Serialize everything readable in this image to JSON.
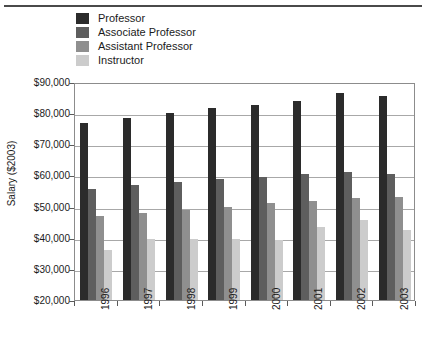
{
  "chart_data": {
    "type": "bar",
    "title": "",
    "xlabel": "",
    "ylabel": "Salary ($2003)",
    "categories": [
      "1996",
      "1997",
      "1998",
      "1999",
      "2000",
      "2001",
      "2002",
      "2003"
    ],
    "ylim": [
      20000,
      90000
    ],
    "ytick_values": [
      20000,
      30000,
      40000,
      50000,
      60000,
      70000,
      80000,
      90000
    ],
    "ytick_labels": [
      "$20,000",
      "$30,000",
      "$40,000",
      "$50,000",
      "$60,000",
      "$70,000",
      "$80,000",
      "$90,000"
    ],
    "grid": true,
    "legend_position": "top",
    "series": [
      {
        "name": "Professor",
        "color": "#2b2b2b",
        "values": [
          77000,
          78300,
          80000,
          81500,
          82500,
          84000,
          86500,
          85500
        ]
      },
      {
        "name": "Associate Professor",
        "color": "#5e5e5e",
        "values": [
          55500,
          56800,
          58000,
          58800,
          59500,
          60500,
          61200,
          60500
        ]
      },
      {
        "name": "Assistant Professor",
        "color": "#8f8f8f",
        "values": [
          47000,
          48000,
          49000,
          50000,
          51000,
          51800,
          52800,
          53000
        ]
      },
      {
        "name": "Instructor",
        "color": "#cccccc",
        "values": [
          36000,
          39500,
          39500,
          39500,
          39200,
          43500,
          45800,
          42500
        ]
      }
    ]
  },
  "legend": {
    "items": [
      {
        "label": "Professor",
        "color": "#2b2b2b"
      },
      {
        "label": "Associate Professor",
        "color": "#5e5e5e"
      },
      {
        "label": "Assistant Professor",
        "color": "#8f8f8f"
      },
      {
        "label": "Instructor",
        "color": "#cccccc"
      }
    ]
  }
}
